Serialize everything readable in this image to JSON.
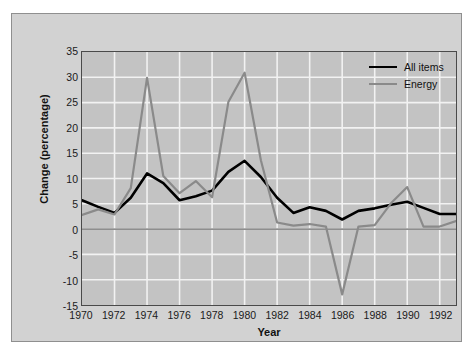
{
  "chart_data": {
    "type": "line",
    "title": "",
    "xlabel": "Year",
    "ylabel": "Change (percentage)",
    "xlim": [
      1970,
      1993
    ],
    "ylim": [
      -15,
      35
    ],
    "ytick_step": 5,
    "xtick_step": 2,
    "grid": true,
    "legend_position": "top-right",
    "plot_background": "#c3c3c3",
    "gridline_color": "#f2f2f2",
    "zero_line": 0,
    "x": [
      1970,
      1971,
      1972,
      1973,
      1974,
      1975,
      1976,
      1977,
      1978,
      1979,
      1980,
      1981,
      1982,
      1983,
      1984,
      1985,
      1986,
      1987,
      1988,
      1989,
      1990,
      1991,
      1992,
      1993
    ],
    "xtick_labels": [
      "1970",
      "1972",
      "1974",
      "1976",
      "1978",
      "1980",
      "1982",
      "1984",
      "1986",
      "1988",
      "1990",
      "1992"
    ],
    "xtick_values": [
      1970,
      1972,
      1974,
      1976,
      1978,
      1980,
      1982,
      1984,
      1986,
      1988,
      1990,
      1992
    ],
    "ytick_labels": [
      "35",
      "30",
      "25",
      "20",
      "15",
      "10",
      "5",
      "0",
      "-5",
      "-10",
      "-15"
    ],
    "ytick_values": [
      35,
      30,
      25,
      20,
      15,
      10,
      5,
      0,
      -5,
      -10,
      -15
    ],
    "series": [
      {
        "name": "All items",
        "color": "#000000",
        "width": 2.6,
        "values": [
          5.7,
          4.4,
          3.2,
          6.2,
          11.0,
          9.1,
          5.7,
          6.5,
          7.6,
          11.3,
          13.5,
          10.3,
          6.2,
          3.2,
          4.3,
          3.6,
          1.9,
          3.6,
          4.1,
          4.8,
          5.4,
          4.2,
          3.0,
          3.0
        ]
      },
      {
        "name": "Energy",
        "color": "#8a8a8a",
        "width": 2.2,
        "values": [
          2.8,
          3.9,
          2.9,
          8.1,
          29.9,
          10.5,
          7.1,
          9.5,
          6.3,
          25.1,
          30.9,
          13.6,
          1.3,
          0.7,
          1.0,
          0.5,
          -12.9,
          0.5,
          0.8,
          5.1,
          8.3,
          0.5,
          0.5,
          1.6
        ]
      }
    ]
  },
  "legend": {
    "items": [
      {
        "label": "All items",
        "color": "#000000"
      },
      {
        "label": "Energy",
        "color": "#8a8a8a"
      }
    ]
  }
}
